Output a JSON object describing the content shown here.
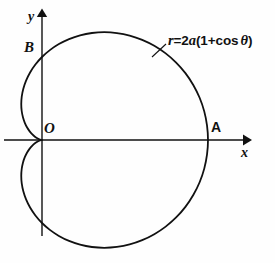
{
  "figure": {
    "kind": "polar-curve-diagram",
    "background_color": "#fefefe",
    "ink_color": "#111111"
  },
  "equation": {
    "r_symbol": "r",
    "equals": "=",
    "coefficient": "2",
    "a_symbol": "a",
    "open_paren": "(1+cos",
    "theta_symbol": "θ",
    "close_paren": ")",
    "full_text": "r=2a(1+cos θ)"
  },
  "axes": {
    "x_label": "x",
    "y_label": "y",
    "origin_label": "O",
    "x_arrow": "arrow-right",
    "y_arrow": "arrow-up"
  },
  "points": [
    {
      "name": "A",
      "label": "A",
      "style": "roman",
      "description": "curve crosses positive x-axis at r = 4a"
    },
    {
      "name": "B",
      "label": "B",
      "style": "italic",
      "description": "curve crosses positive y-axis at r = 2a"
    },
    {
      "name": "O",
      "label": "O",
      "style": "italic",
      "description": "cusp of the cardioid at the origin"
    }
  ],
  "chart_data": {
    "type": "line",
    "polar": true,
    "equation": "r=2a(1+cos θ)",
    "xlabel": "x",
    "ylabel": "y",
    "grid": false,
    "legend": null,
    "a": 1,
    "r_max": 4,
    "theta_range_deg": [
      0,
      360
    ],
    "annotations": [
      {
        "label": "A",
        "theta_deg": 0,
        "r": 4,
        "x": 4,
        "y": 0
      },
      {
        "label": "B",
        "theta_deg": 90,
        "r": 2,
        "x": 0,
        "y": 2
      },
      {
        "label": "O",
        "theta_deg": 180,
        "r": 0,
        "x": 0,
        "y": 0
      }
    ],
    "axis_ranges": {
      "x": [
        -1.1,
        5.2
      ],
      "y": [
        -3.1,
        3.6
      ]
    },
    "series": [
      {
        "name": "cardioid",
        "theta_deg": [
          0,
          5,
          10,
          15,
          20,
          25,
          30,
          35,
          40,
          45,
          50,
          55,
          60,
          65,
          70,
          75,
          80,
          85,
          90,
          95,
          100,
          105,
          110,
          115,
          120,
          125,
          130,
          135,
          140,
          145,
          150,
          155,
          160,
          165,
          170,
          175,
          180,
          185,
          190,
          195,
          200,
          205,
          210,
          215,
          220,
          225,
          230,
          235,
          240,
          245,
          250,
          255,
          260,
          265,
          270,
          275,
          280,
          285,
          290,
          295,
          300,
          305,
          310,
          315,
          320,
          325,
          330,
          335,
          340,
          345,
          350,
          355,
          360
        ],
        "r": [
          4.0,
          3.992,
          3.97,
          3.932,
          3.879,
          3.813,
          3.732,
          3.638,
          3.532,
          3.414,
          3.286,
          3.147,
          3.0,
          2.845,
          2.684,
          2.518,
          2.347,
          2.174,
          2.0,
          1.826,
          1.653,
          1.482,
          1.316,
          1.155,
          1.0,
          0.853,
          0.714,
          0.586,
          0.468,
          0.362,
          0.268,
          0.188,
          0.121,
          0.068,
          0.03,
          0.008,
          0.0,
          0.008,
          0.03,
          0.068,
          0.121,
          0.188,
          0.268,
          0.362,
          0.468,
          0.586,
          0.714,
          0.853,
          1.0,
          1.155,
          1.316,
          1.482,
          1.653,
          1.826,
          2.0,
          2.174,
          2.347,
          2.518,
          2.684,
          2.845,
          3.0,
          3.147,
          3.286,
          3.414,
          3.532,
          3.638,
          3.732,
          3.813,
          3.879,
          3.932,
          3.97,
          3.992,
          4.0
        ]
      }
    ]
  }
}
